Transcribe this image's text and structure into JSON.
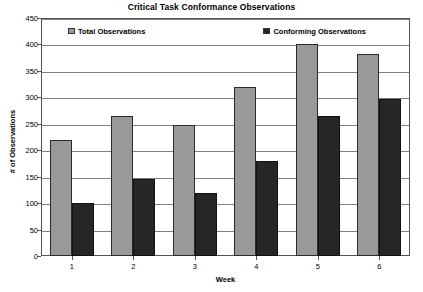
{
  "chart_data": {
    "type": "bar",
    "title": "Critical Task Conformance Observations",
    "xlabel": "Week",
    "ylabel": "# of Observations",
    "categories": [
      "1",
      "2",
      "3",
      "4",
      "5",
      "6"
    ],
    "series": [
      {
        "name": "Total Observations",
        "color": "#999999",
        "values": [
          220,
          265,
          248,
          320,
          400,
          382
        ]
      },
      {
        "name": "Conforming Observations",
        "color": "#262626",
        "values": [
          100,
          145,
          120,
          180,
          265,
          297
        ]
      }
    ],
    "ylim": [
      0,
      450
    ],
    "ytick_step": 50,
    "yticks": [
      0,
      50,
      100,
      150,
      200,
      250,
      300,
      350,
      400,
      450
    ],
    "grid": true,
    "legend_position": "top-inside"
  }
}
